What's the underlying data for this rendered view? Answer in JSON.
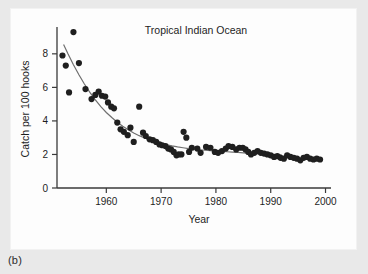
{
  "figure": {
    "caption_label": "(b)",
    "panel_background": "#fdfdfd",
    "page_background": "#e9e9e9"
  },
  "chart_data": {
    "type": "scatter",
    "title": "Tropical Indian Ocean",
    "xlabel": "Year",
    "ylabel": "Catch per 100 hooks",
    "xlim": [
      1951,
      2001
    ],
    "ylim": [
      0,
      9.6
    ],
    "xticks": [
      1960,
      1970,
      1980,
      1990,
      2000
    ],
    "xtick_labels": [
      "1960",
      "1970",
      "1980",
      "1990",
      "2000"
    ],
    "yticks": [
      0,
      2,
      4,
      6,
      8
    ],
    "ytick_labels": [
      "0",
      "2",
      "4",
      "6",
      "8"
    ],
    "grid": false,
    "legend": "none",
    "marker_color": "#1f1f1f",
    "curve_color": "#6f6f6f",
    "axis_color": "#3a3a3a",
    "x": [
      1952,
      1952.6,
      1953.2,
      1954.0,
      1955.0,
      1956.2,
      1957.3,
      1958.0,
      1958.6,
      1959.2,
      1959.8,
      1960.3,
      1960.9,
      1961.4,
      1962.0,
      1962.6,
      1963.2,
      1963.9,
      1964.4,
      1965.0,
      1966.0,
      1966.7,
      1967.2,
      1967.9,
      1968.5,
      1969.1,
      1969.7,
      1970.2,
      1970.8,
      1971.3,
      1971.8,
      1972.3,
      1972.8,
      1973.2,
      1973.7,
      1974.1,
      1974.6,
      1975.1,
      1975.6,
      1976.6,
      1977.2,
      1978.2,
      1979.0,
      1979.8,
      1980.4,
      1981.1,
      1981.8,
      1982.3,
      1983.0,
      1983.7,
      1984.3,
      1984.9,
      1985.4,
      1985.9,
      1986.4,
      1987.0,
      1987.6,
      1988.2,
      1988.8,
      1989.4,
      1990.0,
      1990.6,
      1991.2,
      1991.8,
      1992.4,
      1993.0,
      1993.6,
      1994.2,
      1994.8,
      1995.4,
      1996.0,
      1996.6,
      1997.2,
      1997.8,
      1998.4,
      1999.0
    ],
    "y": [
      7.9,
      7.3,
      5.7,
      9.3,
      7.45,
      5.9,
      5.3,
      5.55,
      5.75,
      5.5,
      5.45,
      5.1,
      4.85,
      4.75,
      3.9,
      3.5,
      3.35,
      3.15,
      3.6,
      2.75,
      4.85,
      3.3,
      3.1,
      2.9,
      2.85,
      2.75,
      2.6,
      2.55,
      2.5,
      2.35,
      2.3,
      2.15,
      1.95,
      2.0,
      2.0,
      3.35,
      3.0,
      2.15,
      2.4,
      2.35,
      2.1,
      2.45,
      2.4,
      2.15,
      2.1,
      2.2,
      2.35,
      2.5,
      2.45,
      2.3,
      2.4,
      2.4,
      2.3,
      2.15,
      2.0,
      2.1,
      2.2,
      2.1,
      2.05,
      2.0,
      1.95,
      1.85,
      1.9,
      1.8,
      1.75,
      1.95,
      1.85,
      1.8,
      1.75,
      1.65,
      1.8,
      1.85,
      1.75,
      1.7,
      1.75,
      1.7
    ],
    "fit_curve": {
      "label": "fitted decline curve",
      "x": [
        1952.2,
        1953,
        1954,
        1955,
        1956,
        1957,
        1958,
        1959,
        1960,
        1961,
        1962,
        1963,
        1964,
        1965,
        1966,
        1967,
        1968,
        1969,
        1970,
        1971,
        1972,
        1973,
        1974,
        1975,
        1976,
        1977,
        1978,
        1979,
        1980,
        1981,
        1982,
        1983,
        1984,
        1985,
        1986,
        1987,
        1988,
        1989,
        1990,
        1991,
        1992
      ],
      "y": [
        8.55,
        8.0,
        7.35,
        6.75,
        6.2,
        5.7,
        5.25,
        4.85,
        4.5,
        4.2,
        3.92,
        3.68,
        3.47,
        3.28,
        3.12,
        2.98,
        2.86,
        2.75,
        2.66,
        2.58,
        2.51,
        2.45,
        2.4,
        2.35,
        2.31,
        2.28,
        2.25,
        2.22,
        2.2,
        2.18,
        2.16,
        2.14,
        2.12,
        2.1,
        2.08,
        2.06,
        2.04,
        2.02,
        2.0,
        1.99,
        1.98
      ]
    }
  }
}
